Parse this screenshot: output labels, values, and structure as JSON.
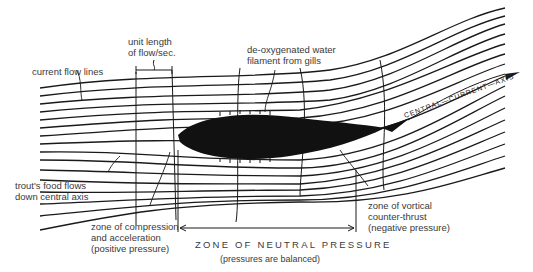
{
  "diagram": {
    "labels": {
      "unit_length": "unit length\nof flow/sec.",
      "current_flow_lines": "current flow lines",
      "deoxygenated": "de-oxygenated water\nfilament from gills",
      "central_axis": "CENTRAL—CURRENT—AXIS",
      "food_flows": "trout's food flows\ndown central axis",
      "compression": "zone of compression\nand acceleration\n(positive pressure)",
      "vortical": "zone of vortical\ncounter-thrust\n(negative pressure)",
      "neutral_zone": "ZONE OF NEUTRAL PRESSURE",
      "neutral_sub": "(pressures are balanced)"
    },
    "colors": {
      "ink": "#1a1a1a",
      "text": "#3a3a3a",
      "background": "#ffffff"
    }
  }
}
